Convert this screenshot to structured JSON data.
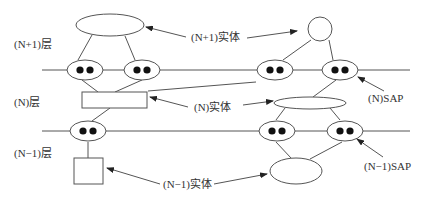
{
  "diagram": {
    "layers": [
      {
        "label": "(N+1)层"
      },
      {
        "label": "(N)层"
      },
      {
        "label": "(N−1)层"
      }
    ],
    "callouts": {
      "n_plus_1_entity": "(N+1)实体",
      "n_entity": "(N)实体",
      "n_minus_1_entity": "(N−1)实体",
      "n_sap": "(N)SAP",
      "n_minus_1_sap": "(N−1)SAP"
    }
  }
}
